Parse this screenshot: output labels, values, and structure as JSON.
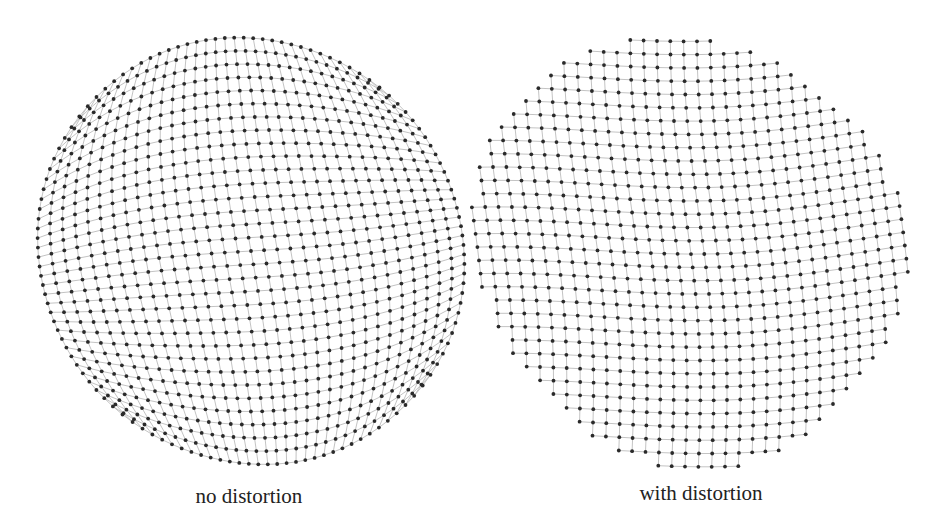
{
  "figure": {
    "panels": [
      {
        "id": "no-distortion",
        "caption": "no distortion",
        "center": [
          251,
          251
        ],
        "radius": 213,
        "grid_n": 33,
        "shape": "disk",
        "distortion": 0
      },
      {
        "id": "with-distortion",
        "caption": "with distortion",
        "center": [
          687,
          246
        ],
        "radius": 213,
        "grid_n": 33,
        "shape": "disk-cut-corners",
        "distortion": 1
      }
    ],
    "colors": {
      "background": "#ffffff",
      "node": "#2a2a2a",
      "edge": "#b4b4b4",
      "caption": "#222222"
    }
  }
}
